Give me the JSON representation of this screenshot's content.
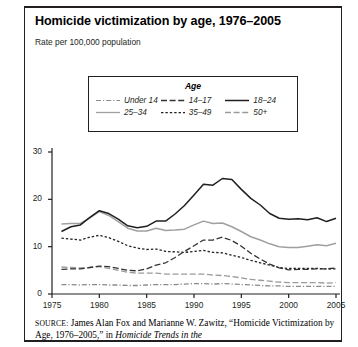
{
  "figure": {
    "title": "Homicide victimization by age, 1976–2005",
    "subtitle": "Rate per 100,000 population",
    "source_prefix": "SOURCE:",
    "source_text_1": " James Alan Fox and Marianne W. Zawitz, “Homicide",
    "source_text_2": "Victimization by Age, 1976–2005,” in ",
    "source_italic": "Homicide Trends in the"
  },
  "legend": {
    "title": "Age",
    "items": [
      {
        "label": "Under 14",
        "style": "dash-dot",
        "color": "#8a8a8a"
      },
      {
        "label": "14–17",
        "style": "dashed",
        "color": "#333333"
      },
      {
        "label": "18–24",
        "style": "solid",
        "color": "#231f20"
      },
      {
        "label": "25–34",
        "style": "solid",
        "color": "#a0a0a0"
      },
      {
        "label": "35–49",
        "style": "dotted",
        "color": "#231f20"
      },
      {
        "label": "50+",
        "style": "dashed",
        "color": "#9a9a9a"
      }
    ]
  },
  "chart_data": {
    "type": "line",
    "title": "Homicide victimization by age, 1976–2005",
    "xlabel": "",
    "ylabel": "Rate per 100,000 population",
    "xlim": [
      1975,
      2005
    ],
    "ylim": [
      0,
      30
    ],
    "yticks": [
      0,
      10,
      20,
      30
    ],
    "xticks": [
      1975,
      1980,
      1985,
      1990,
      1995,
      2000,
      2005
    ],
    "grid": false,
    "legend_position": "top-center",
    "x": [
      1976,
      1977,
      1978,
      1979,
      1980,
      1981,
      1982,
      1983,
      1984,
      1985,
      1986,
      1987,
      1988,
      1989,
      1990,
      1991,
      1992,
      1993,
      1994,
      1995,
      1996,
      1997,
      1998,
      1999,
      2000,
      2001,
      2002,
      2003,
      2004,
      2005
    ],
    "series": [
      {
        "name": "Under 14",
        "values": [
          2.0,
          2.0,
          1.9,
          2.0,
          2.0,
          1.9,
          1.9,
          1.8,
          1.8,
          1.9,
          2.0,
          2.0,
          2.0,
          2.1,
          2.2,
          2.2,
          2.1,
          2.2,
          2.1,
          2.0,
          1.9,
          1.8,
          1.7,
          1.7,
          1.6,
          1.6,
          1.6,
          1.6,
          1.6,
          1.6
        ]
      },
      {
        "name": "14–17",
        "values": [
          5.2,
          5.3,
          5.3,
          5.6,
          5.9,
          5.8,
          5.4,
          5.0,
          4.9,
          5.3,
          6.1,
          6.6,
          7.7,
          9.0,
          10.2,
          11.4,
          11.4,
          12.0,
          11.3,
          10.1,
          8.6,
          7.4,
          6.3,
          5.5,
          5.1,
          5.2,
          5.2,
          5.3,
          5.3,
          5.5
        ]
      },
      {
        "name": "18–24",
        "values": [
          13.2,
          14.2,
          14.6,
          16.2,
          17.6,
          17.0,
          15.8,
          14.4,
          14.0,
          14.3,
          15.4,
          15.4,
          16.9,
          18.7,
          20.9,
          23.2,
          23.0,
          24.4,
          24.2,
          22.1,
          20.2,
          18.8,
          17.0,
          16.0,
          15.8,
          15.9,
          15.7,
          16.1,
          15.3,
          16.0
        ]
      },
      {
        "name": "25–34",
        "values": [
          14.8,
          14.9,
          14.9,
          16.1,
          17.4,
          16.6,
          15.3,
          13.9,
          13.3,
          13.3,
          13.9,
          13.4,
          13.5,
          13.7,
          14.6,
          15.4,
          14.9,
          15.0,
          14.2,
          13.2,
          12.1,
          11.4,
          10.6,
          10.0,
          9.8,
          9.8,
          10.1,
          10.4,
          10.2,
          10.7
        ]
      },
      {
        "name": "35–49",
        "values": [
          11.8,
          11.6,
          11.4,
          12.0,
          12.4,
          11.9,
          11.1,
          10.2,
          9.7,
          9.4,
          9.5,
          9.0,
          8.9,
          8.8,
          9.0,
          9.2,
          8.8,
          8.7,
          8.2,
          7.7,
          7.1,
          6.6,
          6.1,
          5.6,
          5.4,
          5.4,
          5.4,
          5.4,
          5.3,
          5.3
        ]
      },
      {
        "name": "50+",
        "values": [
          5.7,
          5.6,
          5.5,
          5.6,
          5.8,
          5.4,
          5.0,
          4.6,
          4.4,
          4.4,
          4.4,
          4.2,
          4.2,
          4.2,
          4.2,
          4.2,
          4.0,
          3.9,
          3.7,
          3.4,
          3.1,
          2.9,
          2.7,
          2.5,
          2.4,
          2.4,
          2.4,
          2.4,
          2.3,
          2.4
        ]
      }
    ]
  }
}
